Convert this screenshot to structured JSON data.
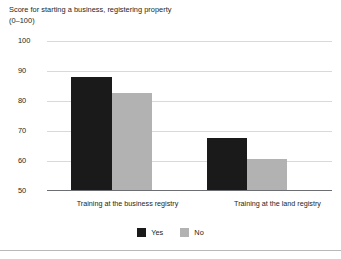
{
  "chart_data": {
    "type": "bar",
    "title": "Score for starting a business, registering property",
    "subtitle": "(0–100)",
    "xlabel": "",
    "ylabel": "",
    "ylim": [
      50,
      100
    ],
    "yticks": [
      100,
      90,
      80,
      70,
      60,
      50
    ],
    "grid": true,
    "legend_position": "bottom-center",
    "categories": [
      "Training at the business registry",
      "Training at the land registry"
    ],
    "series": [
      {
        "name": "Yes",
        "color": "#1a1a1a",
        "values": [
          88,
          67.5
        ]
      },
      {
        "name": "No",
        "color": "#b2b2b2",
        "values": [
          82.5,
          60.5
        ]
      }
    ]
  },
  "axis": {
    "tick_labels": [
      "100",
      "90",
      "80",
      "70",
      "60",
      "50"
    ]
  },
  "categories": {
    "first": "Training at the business registry",
    "second": "Training at the land registry"
  },
  "legend": {
    "yes_label": "Yes",
    "no_label": "No"
  },
  "colors": {
    "yes": "#1a1a1a",
    "no": "#b2b2b2",
    "grid": "#d9d9d9",
    "axis": "#6d6e71",
    "text": "#231f20"
  }
}
